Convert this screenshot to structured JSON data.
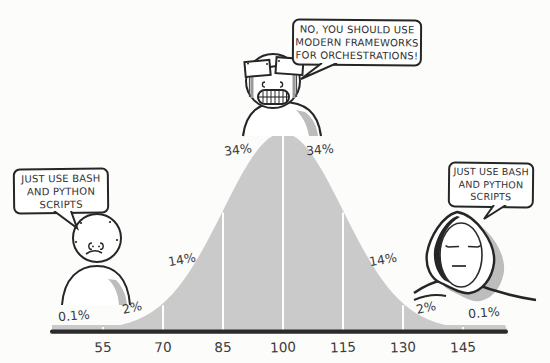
{
  "chart_data": {
    "type": "area",
    "distribution": {
      "mean": 100,
      "sd": 15
    },
    "x_ticks": [
      55,
      70,
      85,
      100,
      115,
      130,
      145
    ],
    "segment_labels": [
      "0.1%",
      "2%",
      "14%",
      "34%",
      "34%",
      "14%",
      "2%",
      "0.1%"
    ],
    "segment_values": [
      0.1,
      2,
      14,
      34,
      34,
      14,
      2,
      0.1
    ],
    "fill_color": "#cacaca",
    "axis_color": "#2b2b2b",
    "gridline_color": "#ffffff",
    "grid": "vertical-white-lines-at-ticks",
    "legend": "none",
    "title": "",
    "xlabel": "",
    "ylabel": ""
  },
  "speech_bubbles": {
    "left": {
      "text": "JUST USE BASH\nAND PYTHON\nSCRIPTS"
    },
    "center": {
      "text": "NO, YOU SHOULD USE\nMODERN FRAMEWORKS\nFOR ORCHESTRATIONS!"
    },
    "right": {
      "text": "JUST USE BASH\nAND PYTHON\nSCRIPTS"
    }
  },
  "characters": {
    "left": "low-iq-wojak",
    "center": "midwit-crying-wojak-with-taped-glasses",
    "right": "hooded-sage-wojak"
  },
  "colors": {
    "outline": "#262626",
    "shading": "#bdbdbd",
    "background": "#fcfcfa"
  }
}
